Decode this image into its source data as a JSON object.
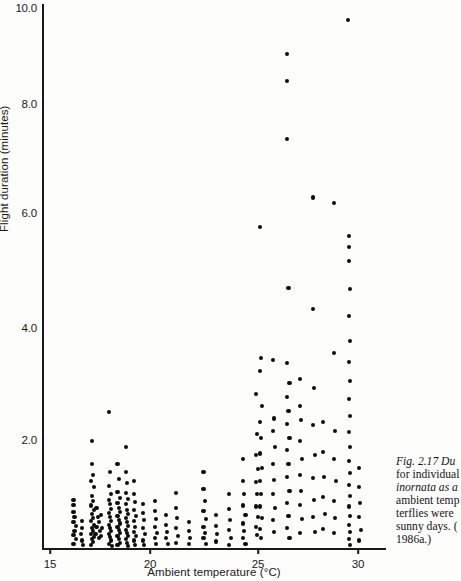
{
  "figure": {
    "caption_lines": [
      "Fig. 2.17  Du",
      "for individual",
      "inornata as a",
      "ambient temp",
      "terflies were",
      "sunny days. (",
      "1986a.)"
    ],
    "caption_label": "Fig. 2.17",
    "caption_italic_species": "inornata"
  },
  "axes": {
    "xlabel": "Ambient temperature (°C)",
    "ylabel": "Flight duration (minutes)",
    "xticks": [
      "15",
      "20",
      "25",
      "30"
    ],
    "yticks": [
      "10.0",
      "8.0",
      "6.0",
      "4.0",
      "2.0"
    ]
  },
  "colors": {
    "ink": "#0d0d0d",
    "axis": "#191919",
    "paper": "#fdfdfc"
  },
  "chart_data": {
    "type": "scatter",
    "title": "",
    "xlabel": "Ambient temperature (°C)",
    "ylabel": "Flight duration (minutes)",
    "xlim": [
      14.6,
      31.0
    ],
    "ylim": [
      0.0,
      10.3
    ],
    "xticks": [
      15,
      20,
      25,
      30
    ],
    "yticks": [
      2.0,
      4.0,
      6.0,
      8.0,
      10.0
    ],
    "grid": false,
    "legend": null,
    "marker": "filled-circle",
    "points": [
      [
        16.1,
        0.95
      ],
      [
        16.1,
        0.85
      ],
      [
        16.1,
        0.72
      ],
      [
        16.15,
        0.62
      ],
      [
        16.1,
        0.52
      ],
      [
        16.2,
        0.45
      ],
      [
        16.15,
        0.36
      ],
      [
        16.1,
        0.28
      ],
      [
        16.2,
        0.2
      ],
      [
        16.1,
        0.12
      ],
      [
        16.5,
        0.55
      ],
      [
        16.5,
        0.42
      ],
      [
        16.45,
        0.3
      ],
      [
        16.5,
        0.18
      ],
      [
        16.55,
        0.1
      ],
      [
        17.0,
        2.05
      ],
      [
        17.0,
        1.62
      ],
      [
        17.05,
        1.42
      ],
      [
        16.95,
        1.3
      ],
      [
        17.1,
        1.18
      ],
      [
        17.0,
        1.02
      ],
      [
        17.05,
        0.92
      ],
      [
        16.95,
        0.84
      ],
      [
        17.1,
        0.76
      ],
      [
        17.0,
        0.68
      ],
      [
        17.05,
        0.6
      ],
      [
        16.95,
        0.54
      ],
      [
        17.1,
        0.48
      ],
      [
        17.0,
        0.42
      ],
      [
        17.05,
        0.36
      ],
      [
        16.95,
        0.3
      ],
      [
        17.1,
        0.25
      ],
      [
        17.0,
        0.2
      ],
      [
        17.05,
        0.15
      ],
      [
        16.95,
        0.1
      ],
      [
        17.15,
        0.3
      ],
      [
        17.2,
        0.44
      ],
      [
        17.25,
        0.62
      ],
      [
        17.2,
        0.8
      ],
      [
        17.3,
        0.52
      ],
      [
        17.35,
        0.36
      ],
      [
        17.3,
        0.22
      ],
      [
        17.4,
        0.66
      ],
      [
        17.45,
        0.42
      ],
      [
        17.4,
        0.26
      ],
      [
        17.8,
        2.6
      ],
      [
        17.85,
        1.48
      ],
      [
        17.8,
        1.2
      ],
      [
        17.9,
        1.05
      ],
      [
        17.8,
        0.95
      ],
      [
        17.85,
        0.86
      ],
      [
        17.9,
        0.78
      ],
      [
        17.8,
        0.7
      ],
      [
        17.85,
        0.62
      ],
      [
        17.9,
        0.55
      ],
      [
        17.8,
        0.48
      ],
      [
        17.85,
        0.42
      ],
      [
        17.9,
        0.36
      ],
      [
        17.8,
        0.3
      ],
      [
        17.85,
        0.24
      ],
      [
        17.9,
        0.18
      ],
      [
        17.8,
        0.12
      ],
      [
        17.95,
        0.08
      ],
      [
        18.2,
        1.62
      ],
      [
        18.25,
        1.34
      ],
      [
        18.2,
        1.1
      ],
      [
        18.3,
        0.98
      ],
      [
        18.2,
        0.88
      ],
      [
        18.25,
        0.8
      ],
      [
        18.3,
        0.72
      ],
      [
        18.2,
        0.64
      ],
      [
        18.25,
        0.56
      ],
      [
        18.3,
        0.5
      ],
      [
        18.2,
        0.44
      ],
      [
        18.25,
        0.38
      ],
      [
        18.3,
        0.32
      ],
      [
        18.2,
        0.26
      ],
      [
        18.25,
        0.2
      ],
      [
        18.3,
        0.14
      ],
      [
        18.2,
        0.09
      ],
      [
        18.6,
        1.95
      ],
      [
        18.6,
        1.48
      ],
      [
        18.65,
        1.26
      ],
      [
        18.6,
        1.08
      ],
      [
        18.7,
        0.96
      ],
      [
        18.6,
        0.86
      ],
      [
        18.65,
        0.76
      ],
      [
        18.7,
        0.68
      ],
      [
        18.6,
        0.6
      ],
      [
        18.65,
        0.52
      ],
      [
        18.7,
        0.45
      ],
      [
        18.6,
        0.38
      ],
      [
        18.65,
        0.32
      ],
      [
        18.7,
        0.26
      ],
      [
        18.6,
        0.2
      ],
      [
        18.65,
        0.14
      ],
      [
        18.7,
        0.08
      ],
      [
        19.0,
        1.3
      ],
      [
        19.0,
        1.05
      ],
      [
        19.05,
        0.9
      ],
      [
        19.0,
        0.76
      ],
      [
        19.1,
        0.64
      ],
      [
        19.0,
        0.54
      ],
      [
        19.05,
        0.44
      ],
      [
        19.0,
        0.34
      ],
      [
        19.1,
        0.26
      ],
      [
        19.0,
        0.18
      ],
      [
        19.05,
        0.1
      ],
      [
        19.4,
        0.86
      ],
      [
        19.4,
        0.7
      ],
      [
        19.45,
        0.56
      ],
      [
        19.4,
        0.42
      ],
      [
        19.5,
        0.3
      ],
      [
        19.4,
        0.18
      ],
      [
        19.45,
        0.1
      ],
      [
        20.0,
        0.92
      ],
      [
        20.0,
        0.74
      ],
      [
        20.05,
        0.58
      ],
      [
        20.0,
        0.44
      ],
      [
        20.1,
        0.32
      ],
      [
        20.0,
        0.22
      ],
      [
        20.05,
        0.12
      ],
      [
        20.5,
        0.66
      ],
      [
        20.5,
        0.48
      ],
      [
        20.55,
        0.34
      ],
      [
        20.5,
        0.22
      ],
      [
        20.6,
        0.12
      ],
      [
        21.0,
        1.08
      ],
      [
        21.0,
        0.8
      ],
      [
        21.05,
        0.6
      ],
      [
        21.0,
        0.42
      ],
      [
        21.1,
        0.26
      ],
      [
        21.0,
        0.14
      ],
      [
        21.6,
        0.52
      ],
      [
        21.6,
        0.36
      ],
      [
        21.65,
        0.22
      ],
      [
        21.6,
        0.12
      ],
      [
        22.3,
        1.48
      ],
      [
        22.3,
        1.15
      ],
      [
        22.35,
        0.92
      ],
      [
        22.3,
        0.74
      ],
      [
        22.4,
        0.58
      ],
      [
        22.3,
        0.44
      ],
      [
        22.35,
        0.32
      ],
      [
        22.3,
        0.22
      ],
      [
        22.4,
        0.12
      ],
      [
        22.9,
        0.66
      ],
      [
        22.9,
        0.46
      ],
      [
        22.95,
        0.3
      ],
      [
        22.9,
        0.16
      ],
      [
        23.5,
        1.05
      ],
      [
        23.5,
        0.78
      ],
      [
        23.55,
        0.56
      ],
      [
        23.5,
        0.38
      ],
      [
        23.6,
        0.22
      ],
      [
        23.5,
        0.1
      ],
      [
        24.2,
        1.72
      ],
      [
        24.2,
        1.3
      ],
      [
        24.25,
        1.05
      ],
      [
        24.2,
        0.84
      ],
      [
        24.3,
        0.66
      ],
      [
        24.2,
        0.5
      ],
      [
        24.25,
        0.36
      ],
      [
        24.2,
        0.22
      ],
      [
        24.3,
        0.12
      ],
      [
        24.8,
        2.95
      ],
      [
        24.85,
        2.18
      ],
      [
        24.8,
        1.8
      ],
      [
        24.9,
        1.52
      ],
      [
        24.8,
        1.28
      ],
      [
        24.85,
        1.05
      ],
      [
        24.8,
        0.82
      ],
      [
        24.9,
        0.62
      ],
      [
        24.8,
        0.44
      ],
      [
        24.85,
        0.28
      ],
      [
        25.0,
        6.1
      ],
      [
        25.05,
        3.62
      ],
      [
        25.0,
        3.38
      ],
      [
        25.1,
        2.72
      ],
      [
        25.0,
        2.42
      ],
      [
        25.05,
        2.12
      ],
      [
        25.0,
        1.82
      ],
      [
        25.1,
        1.55
      ],
      [
        25.0,
        1.3
      ],
      [
        25.05,
        1.05
      ],
      [
        25.0,
        0.82
      ],
      [
        25.1,
        0.6
      ],
      [
        25.0,
        0.4
      ],
      [
        25.05,
        0.22
      ],
      [
        25.6,
        3.58
      ],
      [
        25.65,
        2.48
      ],
      [
        25.6,
        2.25
      ],
      [
        25.7,
        1.95
      ],
      [
        25.6,
        1.62
      ],
      [
        25.65,
        1.32
      ],
      [
        25.6,
        1.05
      ],
      [
        25.7,
        0.8
      ],
      [
        25.6,
        0.56
      ],
      [
        25.65,
        0.34
      ],
      [
        26.3,
        9.35
      ],
      [
        26.3,
        8.85
      ],
      [
        26.3,
        7.75
      ],
      [
        26.35,
        4.95
      ],
      [
        26.3,
        3.52
      ],
      [
        26.4,
        3.15
      ],
      [
        26.3,
        2.88
      ],
      [
        26.35,
        2.62
      ],
      [
        26.3,
        2.38
      ],
      [
        26.4,
        2.12
      ],
      [
        26.3,
        1.88
      ],
      [
        26.35,
        1.62
      ],
      [
        26.3,
        1.38
      ],
      [
        26.4,
        1.12
      ],
      [
        26.3,
        0.88
      ],
      [
        26.35,
        0.64
      ],
      [
        26.3,
        0.42
      ],
      [
        26.4,
        0.22
      ],
      [
        26.9,
        3.22
      ],
      [
        26.9,
        2.72
      ],
      [
        26.95,
        2.45
      ],
      [
        26.9,
        2.05
      ],
      [
        27.0,
        1.72
      ],
      [
        26.9,
        1.42
      ],
      [
        26.95,
        1.12
      ],
      [
        26.9,
        0.85
      ],
      [
        27.0,
        0.58
      ],
      [
        26.9,
        0.32
      ],
      [
        27.5,
        6.65
      ],
      [
        27.5,
        4.55
      ],
      [
        27.55,
        3.05
      ],
      [
        27.5,
        2.35
      ],
      [
        27.6,
        1.8
      ],
      [
        27.5,
        1.35
      ],
      [
        27.55,
        0.95
      ],
      [
        27.5,
        0.62
      ],
      [
        27.6,
        0.34
      ],
      [
        28.0,
        2.42
      ],
      [
        28.0,
        1.85
      ],
      [
        28.05,
        1.38
      ],
      [
        28.0,
        1.0
      ],
      [
        28.1,
        0.68
      ],
      [
        28.0,
        0.4
      ],
      [
        28.5,
        6.55
      ],
      [
        28.5,
        3.72
      ],
      [
        28.55,
        2.25
      ],
      [
        28.5,
        1.72
      ],
      [
        28.6,
        1.3
      ],
      [
        28.5,
        0.92
      ],
      [
        28.55,
        0.6
      ],
      [
        28.5,
        0.32
      ],
      [
        29.2,
        10.0
      ],
      [
        29.25,
        5.92
      ],
      [
        29.25,
        5.72
      ],
      [
        29.25,
        5.45
      ],
      [
        29.3,
        4.92
      ],
      [
        29.25,
        4.42
      ],
      [
        29.3,
        3.95
      ],
      [
        29.25,
        3.55
      ],
      [
        29.3,
        3.18
      ],
      [
        29.25,
        2.85
      ],
      [
        29.3,
        2.52
      ],
      [
        29.25,
        2.22
      ],
      [
        29.3,
        1.95
      ],
      [
        29.25,
        1.68
      ],
      [
        29.3,
        1.45
      ],
      [
        29.25,
        1.22
      ],
      [
        29.3,
        1.02
      ],
      [
        29.25,
        0.82
      ],
      [
        29.3,
        0.64
      ],
      [
        29.25,
        0.48
      ],
      [
        29.3,
        0.34
      ],
      [
        29.25,
        0.2
      ],
      [
        29.3,
        0.1
      ],
      [
        29.7,
        1.55
      ],
      [
        29.7,
        1.18
      ],
      [
        29.75,
        0.88
      ],
      [
        29.7,
        0.62
      ],
      [
        29.8,
        0.38
      ],
      [
        29.7,
        0.18
      ]
    ]
  }
}
